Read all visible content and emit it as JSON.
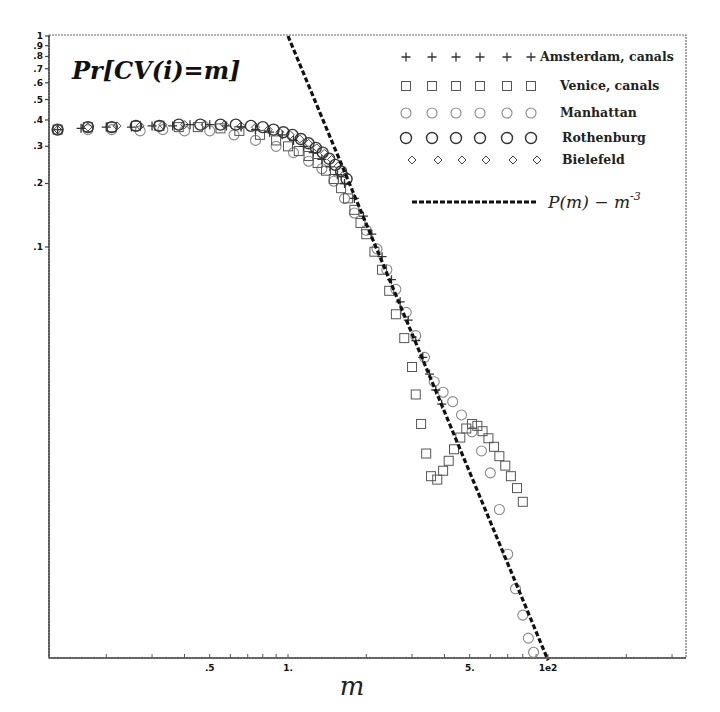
{
  "chart_data": {
    "type": "scatter",
    "title": "Pr[CV(i)=m]",
    "xlabel": "m",
    "ylabel": "",
    "xscale": "log",
    "yscale": "log",
    "xlim": [
      0.12,
      34
    ],
    "ylim": [
      0.0011,
      1
    ],
    "grid": false,
    "legend_position": "upper right",
    "x_ticks": [
      {
        "value": 0.5,
        "label": ".5"
      },
      {
        "value": 1,
        "label": "1."
      },
      {
        "value": 5,
        "label": "5."
      },
      {
        "value": 10,
        "label": "1e2"
      }
    ],
    "y_ticks": [
      {
        "value": 1,
        "label": "1"
      },
      {
        "value": 0.9,
        "label": ".9"
      },
      {
        "value": 0.8,
        "label": ".8"
      },
      {
        "value": 0.7,
        "label": ".7"
      },
      {
        "value": 0.6,
        "label": ".6"
      },
      {
        "value": 0.5,
        "label": ".5"
      },
      {
        "value": 0.4,
        "label": ".4"
      },
      {
        "value": 0.3,
        "label": ".3"
      },
      {
        "value": 0.2,
        "label": ".2"
      },
      {
        "value": 0.1,
        "label": ".1"
      }
    ],
    "series": [
      {
        "name": "Amsterdam, canals",
        "marker": "plus",
        "points": [
          [
            0.13,
            0.36
          ],
          [
            0.16,
            0.365
          ],
          [
            0.2,
            0.37
          ],
          [
            0.25,
            0.37
          ],
          [
            0.3,
            0.375
          ],
          [
            0.36,
            0.375
          ],
          [
            0.42,
            0.38
          ],
          [
            0.5,
            0.38
          ],
          [
            0.58,
            0.375
          ],
          [
            0.66,
            0.37
          ],
          [
            0.75,
            0.36
          ],
          [
            0.85,
            0.35
          ],
          [
            0.95,
            0.34
          ],
          [
            1.05,
            0.32
          ],
          [
            1.15,
            0.3
          ],
          [
            1.25,
            0.28
          ],
          [
            1.35,
            0.26
          ],
          [
            1.45,
            0.24
          ],
          [
            1.55,
            0.22
          ],
          [
            1.65,
            0.2
          ],
          [
            1.8,
            0.17
          ],
          [
            1.95,
            0.14
          ],
          [
            2.1,
            0.115
          ],
          [
            2.3,
            0.09
          ],
          [
            2.5,
            0.07
          ],
          [
            2.7,
            0.055
          ],
          [
            2.9,
            0.045
          ],
          [
            3.1,
            0.036
          ],
          [
            3.3,
            0.03
          ],
          [
            3.5,
            0.025
          ],
          [
            3.7,
            0.021
          ],
          [
            3.9,
            0.018
          ]
        ]
      },
      {
        "name": "Venice, canals",
        "marker": "square",
        "points": [
          [
            0.13,
            0.36
          ],
          [
            0.17,
            0.37
          ],
          [
            0.21,
            0.37
          ],
          [
            0.26,
            0.375
          ],
          [
            0.32,
            0.375
          ],
          [
            0.38,
            0.37
          ],
          [
            0.45,
            0.37
          ],
          [
            0.55,
            0.365
          ],
          [
            0.65,
            0.355
          ],
          [
            0.78,
            0.34
          ],
          [
            0.9,
            0.32
          ],
          [
            1.0,
            0.3
          ],
          [
            1.1,
            0.285
          ],
          [
            1.2,
            0.27
          ],
          [
            1.3,
            0.25
          ],
          [
            1.4,
            0.23
          ],
          [
            1.5,
            0.21
          ],
          [
            1.6,
            0.19
          ],
          [
            1.7,
            0.17
          ],
          [
            1.8,
            0.15
          ],
          [
            1.9,
            0.13
          ],
          [
            2.0,
            0.115
          ],
          [
            2.15,
            0.095
          ],
          [
            2.3,
            0.078
          ],
          [
            2.45,
            0.062
          ],
          [
            2.6,
            0.048
          ],
          [
            2.8,
            0.037
          ],
          [
            3.0,
            0.027
          ],
          [
            3.1,
            0.02
          ],
          [
            3.25,
            0.0145
          ],
          [
            3.4,
            0.0105
          ],
          [
            3.55,
            0.0082
          ],
          [
            3.75,
            0.0079
          ],
          [
            3.95,
            0.0087
          ],
          [
            4.15,
            0.0097
          ],
          [
            4.35,
            0.011
          ],
          [
            4.6,
            0.0125
          ],
          [
            4.85,
            0.0138
          ],
          [
            5.1,
            0.0145
          ],
          [
            5.35,
            0.0142
          ],
          [
            5.6,
            0.0134
          ],
          [
            5.9,
            0.0124
          ],
          [
            6.2,
            0.0113
          ],
          [
            6.5,
            0.0102
          ],
          [
            6.85,
            0.0092
          ],
          [
            7.2,
            0.0082
          ],
          [
            7.6,
            0.0072
          ],
          [
            8.0,
            0.0062
          ]
        ]
      },
      {
        "name": "Manhattan",
        "marker": "circle-small",
        "points": [
          [
            0.13,
            0.36
          ],
          [
            0.17,
            0.36
          ],
          [
            0.21,
            0.36
          ],
          [
            0.27,
            0.355
          ],
          [
            0.33,
            0.36
          ],
          [
            0.4,
            0.355
          ],
          [
            0.5,
            0.355
          ],
          [
            0.62,
            0.34
          ],
          [
            0.75,
            0.32
          ],
          [
            0.9,
            0.3
          ],
          [
            1.05,
            0.28
          ],
          [
            1.2,
            0.255
          ],
          [
            1.35,
            0.235
          ],
          [
            1.5,
            0.205
          ],
          [
            1.65,
            0.17
          ],
          [
            1.8,
            0.145
          ],
          [
            2.0,
            0.12
          ],
          [
            2.2,
            0.098
          ],
          [
            2.4,
            0.078
          ],
          [
            2.6,
            0.063
          ],
          [
            2.85,
            0.049
          ],
          [
            3.1,
            0.038
          ],
          [
            3.35,
            0.03
          ],
          [
            3.65,
            0.023
          ],
          [
            3.95,
            0.0205
          ],
          [
            4.3,
            0.0185
          ],
          [
            4.65,
            0.016
          ],
          [
            5.1,
            0.0133
          ],
          [
            5.55,
            0.0108
          ],
          [
            6.0,
            0.0085
          ],
          [
            6.5,
            0.0057
          ],
          [
            7.0,
            0.0035
          ],
          [
            7.5,
            0.0024
          ],
          [
            8.0,
            0.0018
          ],
          [
            8.4,
            0.0014
          ],
          [
            8.8,
            0.0012
          ]
        ]
      },
      {
        "name": "Rothenburg",
        "marker": "circle-large",
        "points": [
          [
            0.13,
            0.36
          ],
          [
            0.17,
            0.37
          ],
          [
            0.21,
            0.37
          ],
          [
            0.26,
            0.375
          ],
          [
            0.32,
            0.375
          ],
          [
            0.38,
            0.38
          ],
          [
            0.46,
            0.38
          ],
          [
            0.55,
            0.38
          ],
          [
            0.63,
            0.38
          ],
          [
            0.72,
            0.375
          ],
          [
            0.8,
            0.37
          ],
          [
            0.88,
            0.36
          ],
          [
            0.96,
            0.35
          ],
          [
            1.04,
            0.34
          ],
          [
            1.12,
            0.325
          ],
          [
            1.2,
            0.31
          ],
          [
            1.28,
            0.295
          ],
          [
            1.36,
            0.28
          ],
          [
            1.44,
            0.262
          ],
          [
            1.52,
            0.245
          ],
          [
            1.6,
            0.228
          ],
          [
            1.68,
            0.21
          ]
        ]
      },
      {
        "name": "Bielefeld",
        "marker": "diamond",
        "points": [
          [
            0.13,
            0.36
          ],
          [
            0.17,
            0.37
          ],
          [
            0.22,
            0.375
          ],
          [
            0.27,
            0.375
          ],
          [
            0.33,
            0.38
          ],
          [
            0.4,
            0.38
          ],
          [
            0.48,
            0.38
          ],
          [
            0.57,
            0.38
          ],
          [
            0.66,
            0.375
          ],
          [
            0.75,
            0.37
          ],
          [
            0.84,
            0.36
          ],
          [
            0.93,
            0.35
          ],
          [
            1.02,
            0.34
          ],
          [
            1.11,
            0.325
          ],
          [
            1.2,
            0.31
          ],
          [
            1.29,
            0.295
          ],
          [
            1.38,
            0.278
          ],
          [
            1.47,
            0.26
          ],
          [
            1.56,
            0.242
          ],
          [
            1.65,
            0.222
          ]
        ]
      }
    ],
    "reference_line": {
      "name": "P(m) - m^-3",
      "style": "dashed",
      "exponent": -3,
      "points": [
        [
          1.0,
          1.0
        ],
        [
          10.0,
          0.0011
        ]
      ]
    },
    "legend": {
      "entries": [
        {
          "label": "Amsterdam, canals",
          "marker": "plus"
        },
        {
          "label": "Venice, canals",
          "marker": "square"
        },
        {
          "label": "Manhattan",
          "marker": "circle-small"
        },
        {
          "label": "Rothenburg",
          "marker": "circle-large"
        },
        {
          "label": "Bielefeld",
          "marker": "diamond"
        }
      ],
      "line_label_main": "P(m) − m",
      "line_label_exp": "-3"
    }
  },
  "colors": {
    "frame": "#555555",
    "marker_dark": "#333333",
    "marker_light": "#888888",
    "dash": "#111111"
  }
}
